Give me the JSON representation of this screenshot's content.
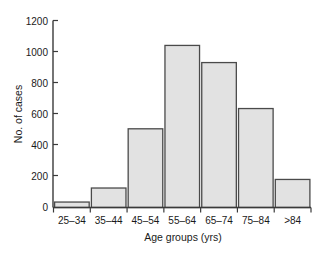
{
  "chart_data": {
    "type": "bar",
    "title": "",
    "subtitle": "",
    "xlabel": "Age groups (yrs)",
    "ylabel": "No. of cases",
    "categories": [
      "25–34",
      "35–44",
      "45–54",
      "55–64",
      "65–74",
      "75–84",
      ">84"
    ],
    "values": [
      35,
      125,
      505,
      1040,
      930,
      635,
      180
    ],
    "ylim": [
      0,
      1200
    ],
    "yticks": [
      0,
      200,
      400,
      600,
      800,
      1000,
      1200
    ],
    "ytick_labels": [
      "0",
      "200",
      "400",
      "600",
      "800",
      "1000",
      "1200"
    ],
    "grid": false,
    "legend": null,
    "legend_position": "none",
    "annotations": [],
    "colors": {
      "bar_fill": "#e2e2e2",
      "bar_stroke": "#4a4a4a",
      "axis": "#3a3a3a",
      "text": "#1a1a1a",
      "background": "#ffffff"
    }
  },
  "labels": {
    "y_axis_title": "No. of cases",
    "x_axis_title": "Age groups (yrs)",
    "ytick_0": "0",
    "ytick_1": "200",
    "ytick_2": "400",
    "ytick_3": "600",
    "ytick_4": "800",
    "ytick_5": "1000",
    "ytick_6": "1200",
    "cat_0": "25–34",
    "cat_1": "35–44",
    "cat_2": "45–54",
    "cat_3": "55–64",
    "cat_4": "65–74",
    "cat_5": "75–84",
    "cat_6": ">84"
  }
}
